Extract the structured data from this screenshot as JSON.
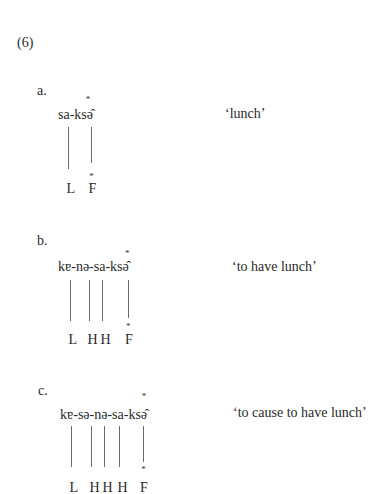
{
  "example_number": "(6)",
  "accent_mark": "*",
  "examples": [
    {
      "label": "a.",
      "form": "sa-ksə̂",
      "gloss": "‘lunch’",
      "tones": [
        "L",
        "F"
      ]
    },
    {
      "label": "b.",
      "form": "kɐ-nə-sa-ksə̂",
      "gloss": "‘to have lunch’",
      "tones": [
        "L",
        "H",
        "H",
        "F"
      ]
    },
    {
      "label": "c.",
      "form": "kɐ-sə-nə-sa-ksə̂",
      "gloss": "‘to cause to have lunch’",
      "tones": [
        "L",
        "H",
        "H",
        "H",
        "F"
      ]
    }
  ]
}
